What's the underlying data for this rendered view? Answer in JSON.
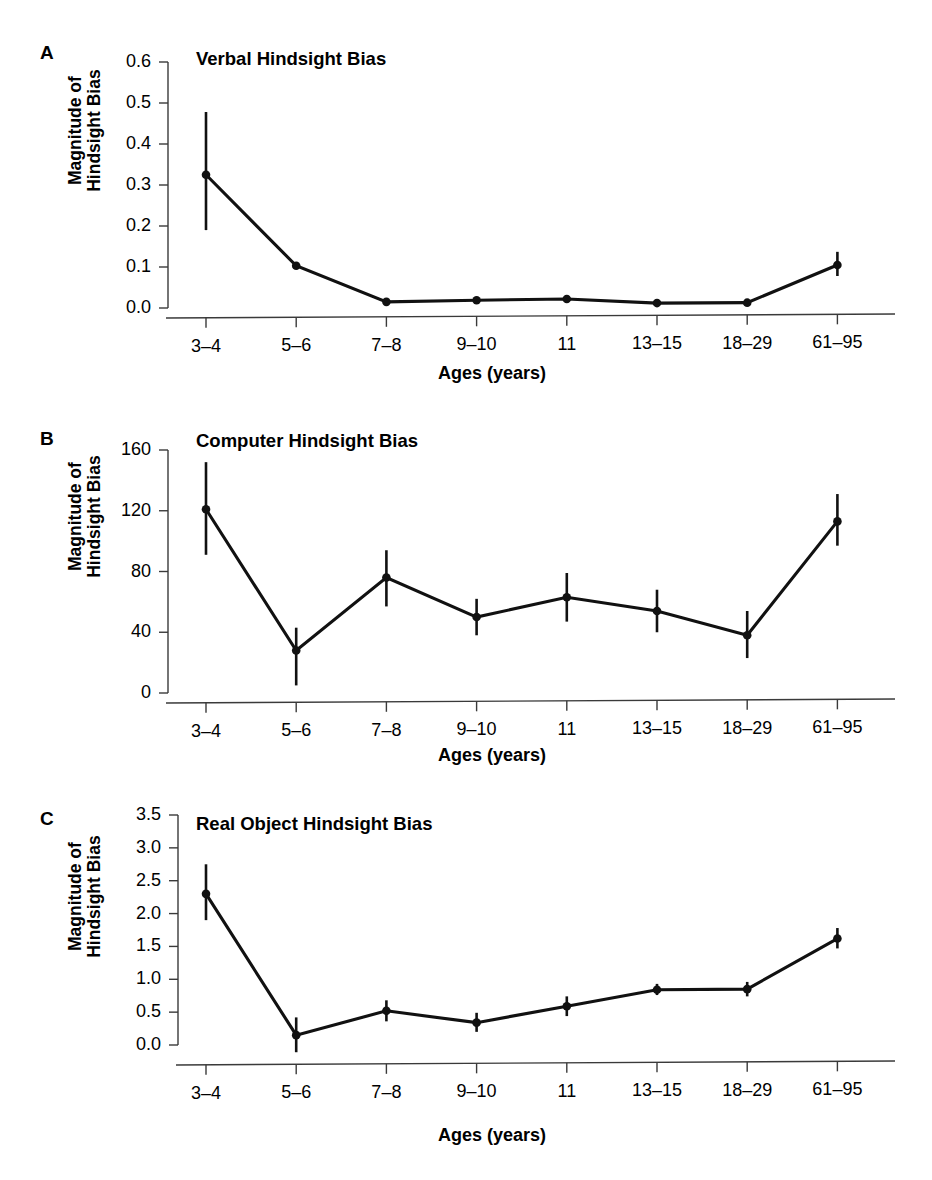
{
  "figure": {
    "background": "#ffffff",
    "ink_color": "#111111",
    "axis_color": "#3a3a3a",
    "xlabel": "Ages (years)",
    "ylabel_line1": "Magnitude of",
    "ylabel_line2": "Hindsight Bias",
    "categories": [
      "3–4",
      "5–6",
      "7–8",
      "9–10",
      "11",
      "13–15",
      "18–29",
      "61–95"
    ]
  },
  "panels": [
    {
      "letter": "A",
      "title": "Verbal Hindsight Bias",
      "ytick_labels": [
        "0.6",
        "0.5",
        "0.4",
        "0.3",
        "0.2",
        "0.1",
        "0.0"
      ]
    },
    {
      "letter": "B",
      "title": "Computer Hindsight Bias",
      "ytick_labels": [
        "160",
        "120",
        "80",
        "40",
        "0"
      ]
    },
    {
      "letter": "C",
      "title": "Real Object Hindsight Bias",
      "ytick_labels": [
        "3.5",
        "3.0",
        "2.5",
        "2.0",
        "1.5",
        "1.0",
        "0.5",
        "0.0"
      ]
    }
  ],
  "chart_data": [
    {
      "type": "line",
      "panel": "A",
      "title": "Verbal Hindsight Bias",
      "xlabel": "Ages (years)",
      "ylabel": "Magnitude of Hindsight Bias",
      "categories": [
        "3–4",
        "5–6",
        "7–8",
        "9–10",
        "11",
        "13–15",
        "18–29",
        "61–95"
      ],
      "values": [
        0.325,
        0.103,
        0.015,
        0.019,
        0.022,
        0.012,
        0.013,
        0.105
      ],
      "error_low": [
        0.19,
        0.103,
        0.015,
        0.019,
        0.022,
        0.012,
        0.013,
        0.078
      ],
      "error_high": [
        0.478,
        0.103,
        0.015,
        0.019,
        0.022,
        0.012,
        0.013,
        0.137
      ],
      "yticks": [
        0.0,
        0.1,
        0.2,
        0.3,
        0.4,
        0.5,
        0.6
      ],
      "ytick_labels": [
        "0.0",
        "0.1",
        "0.2",
        "0.3",
        "0.4",
        "0.5",
        "0.6"
      ],
      "ylim": [
        -0.03,
        0.63
      ],
      "grid": false,
      "legend": "none",
      "markers": "filled-circle",
      "errorbars": true
    },
    {
      "type": "line",
      "panel": "B",
      "title": "Computer Hindsight Bias",
      "xlabel": "Ages (years)",
      "ylabel": "Magnitude of Hindsight Bias",
      "categories": [
        "3–4",
        "5–6",
        "7–8",
        "9–10",
        "11",
        "13–15",
        "18–29",
        "61–95"
      ],
      "values": [
        121,
        28,
        76,
        50,
        63,
        54,
        38,
        113
      ],
      "error_low": [
        91,
        5,
        57,
        38,
        47,
        40,
        23,
        97
      ],
      "error_high": [
        152,
        43,
        94,
        62,
        79,
        68,
        54,
        131
      ],
      "yticks": [
        0,
        40,
        80,
        120,
        160
      ],
      "ytick_labels": [
        "0",
        "40",
        "80",
        "120",
        "160"
      ],
      "ylim": [
        -12,
        168
      ],
      "grid": false,
      "legend": "none",
      "markers": "filled-circle",
      "errorbars": true
    },
    {
      "type": "line",
      "panel": "C",
      "title": "Real Object Hindsight Bias",
      "xlabel": "Ages (years)",
      "ylabel": "Magnitude of Hindsight Bias",
      "categories": [
        "3–4",
        "5–6",
        "7–8",
        "9–10",
        "11",
        "13–15",
        "18–29",
        "61–95"
      ],
      "values": [
        2.3,
        0.15,
        0.52,
        0.34,
        0.59,
        0.84,
        0.85,
        1.62
      ],
      "error_low": [
        1.9,
        -0.11,
        0.36,
        0.2,
        0.44,
        0.76,
        0.74,
        1.47
      ],
      "error_high": [
        2.75,
        0.42,
        0.68,
        0.49,
        0.74,
        0.93,
        0.96,
        1.78
      ],
      "yticks": [
        0.0,
        0.5,
        1.0,
        1.5,
        2.0,
        2.5,
        3.0,
        3.5
      ],
      "ytick_labels": [
        "0.0",
        "0.5",
        "1.0",
        "1.5",
        "2.0",
        "2.5",
        "3.0",
        "3.5"
      ],
      "ylim": [
        -0.25,
        3.6
      ],
      "grid": false,
      "legend": "none",
      "markers": "filled-circle",
      "errorbars": true
    }
  ]
}
